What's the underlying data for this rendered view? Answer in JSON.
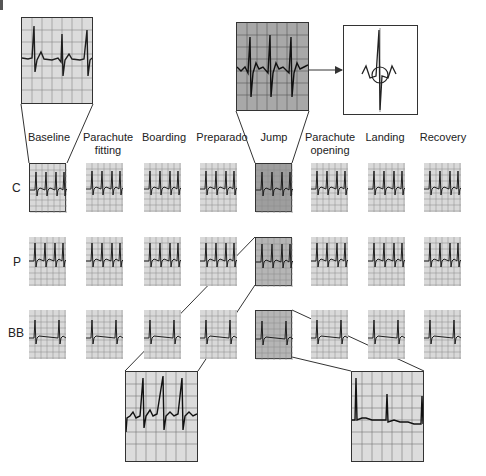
{
  "figure": {
    "panel_marker": "I",
    "columns": [
      "Baseline",
      "Parachute fitting",
      "Boarding",
      "Preparado",
      "Jump",
      "Parachute opening",
      "Landing",
      "Recovery"
    ],
    "column_labels": [
      {
        "line1": "Baseline",
        "line2": ""
      },
      {
        "line1": "Parachute",
        "line2": "fitting"
      },
      {
        "line1": "Boarding",
        "line2": ""
      },
      {
        "line1": "Preparado",
        "line2": ""
      },
      {
        "line1": "Jump",
        "line2": ""
      },
      {
        "line1": "Parachute",
        "line2": "opening"
      },
      {
        "line1": "Landing",
        "line2": ""
      },
      {
        "line1": "Recovery",
        "line2": ""
      }
    ],
    "rows": [
      {
        "label": "C"
      },
      {
        "label": "P"
      },
      {
        "label": "BB"
      }
    ],
    "highlighted_strips": [
      {
        "row": "C",
        "column": "Baseline",
        "enlarged": "top-left"
      },
      {
        "row": "C",
        "column": "Jump",
        "enlarged": "top-center"
      },
      {
        "row": "P",
        "column": "Jump",
        "enlarged": "bottom-left"
      },
      {
        "row": "BB",
        "column": "Jump",
        "enlarged": "bottom-right"
      }
    ],
    "inset": {
      "description": "single QRS complex detail with circled ST segment",
      "linked_from": "top-center enlarged strip"
    },
    "colors": {
      "grid_bg": "#d9d9d9",
      "grid_line": "#8a8a8a",
      "trace": "#1e1e1e",
      "highlight_bg": "#9e9e9e",
      "frame": "#333333"
    }
  }
}
